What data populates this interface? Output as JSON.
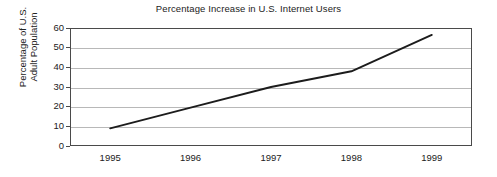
{
  "chart_data": {
    "type": "line",
    "title": "Percentage Increase in U.S. Internet Users",
    "xlabel": "",
    "ylabel": "Percentage of U.S. Adult Population",
    "ylabel_line1": "Percentage of U.S.",
    "ylabel_line2": "Adult Population",
    "categories": [
      "1995",
      "1996",
      "1997",
      "1998",
      "1999"
    ],
    "x": [
      1995,
      1996,
      1997,
      1998,
      1999
    ],
    "values": [
      9,
      19.5,
      30,
      38,
      56.5
    ],
    "series": [
      {
        "name": "Percentage of U.S. Adult Population",
        "values": [
          9,
          19.5,
          30,
          38,
          56.5
        ]
      }
    ],
    "ylim": [
      0,
      60
    ],
    "ytick_labels": [
      "0",
      "10",
      "20",
      "30",
      "40",
      "50",
      "60"
    ],
    "ytick_values": [
      0,
      10,
      20,
      30,
      40,
      50,
      60
    ],
    "xtick_labels": [
      "1995",
      "1996",
      "1997",
      "1998",
      "1999"
    ],
    "grid": "horizontal",
    "legend": "none",
    "line_color": "#1c1c1c",
    "grid_color": "#b8b8b8",
    "axis_color": "#4a4a4a",
    "background_color": "#ffffff"
  }
}
